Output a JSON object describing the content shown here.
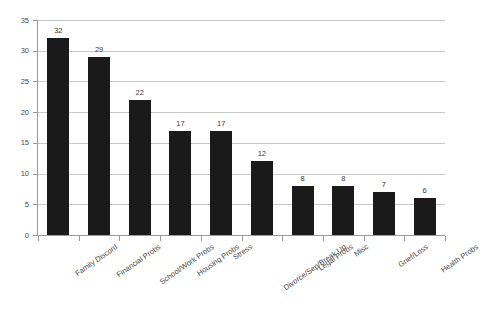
{
  "chart_data": {
    "type": "bar",
    "title": "",
    "subtitle": "",
    "xlabel": "",
    "ylabel": "",
    "ylim": [
      0,
      35
    ],
    "yticks": [
      0,
      5,
      10,
      15,
      20,
      25,
      30,
      35
    ],
    "ytick_labels": [
      "0",
      "5",
      "10",
      "15",
      "20",
      "25",
      "30",
      "35"
    ],
    "grid": true,
    "grid_axis": "y",
    "legend": false,
    "legend_position": "none",
    "bar_color": "#1a1a1a",
    "grid_color": "#c9c9c9",
    "axis_color": "#9a9a9a",
    "background_color": "#ffffff",
    "data_labels": true,
    "categories": [
      "Family Discord",
      "Financial Probs",
      "School/Work Probs",
      "Housing Probs",
      "Stress",
      "Divorce/Sep/Break Up",
      "Legal Probs",
      "Misc",
      "Grief/Loss",
      "Health Probs"
    ],
    "values": [
      32,
      29,
      22,
      17,
      17,
      12,
      8,
      8,
      7,
      6
    ],
    "value_labels": [
      "32",
      "29",
      "22",
      "17",
      "17",
      "12",
      "8",
      "8",
      "7",
      "6"
    ]
  }
}
